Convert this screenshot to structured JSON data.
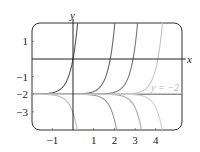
{
  "chart_data": {
    "type": "line",
    "title": "",
    "xlabel": "x",
    "ylabel": "y",
    "xlim": [
      -1.9,
      5.3
    ],
    "ylim": [
      -4.0,
      2.0
    ],
    "grid": false,
    "x_ticks": [
      -1,
      1,
      2,
      3,
      4
    ],
    "y_ticks": [
      1,
      -1,
      -2,
      -3
    ],
    "x_tick_labels": [
      "−1",
      "1",
      "2",
      "3",
      "4"
    ],
    "y_tick_labels": [
      "1",
      "−1",
      "−2",
      "−3"
    ],
    "asymptote": {
      "y": -2,
      "label": "y = −2",
      "style": "dashed",
      "color": "#c8c8c8"
    },
    "series": [
      {
        "name": "upper-solution-1",
        "branch": "upper",
        "zero_crossing_x": 0.0,
        "color": "#555555"
      },
      {
        "name": "upper-solution-2",
        "branch": "upper",
        "zero_crossing_x": 1.8,
        "color": "#666666"
      },
      {
        "name": "upper-solution-3",
        "branch": "upper",
        "zero_crossing_x": 2.9,
        "color": "#777777"
      },
      {
        "name": "upper-solution-4",
        "branch": "upper",
        "zero_crossing_x": 4.1,
        "color": "#c4c4c4"
      },
      {
        "name": "lower-solution-1",
        "branch": "lower",
        "bottom_crossing_x": 0.2,
        "color": "#bbbbbb"
      },
      {
        "name": "lower-solution-2",
        "branch": "lower",
        "bottom_crossing_x": 2.1,
        "color": "#999999"
      },
      {
        "name": "lower-solution-3",
        "branch": "lower",
        "bottom_crossing_x": 3.3,
        "color": "#aaaaaa"
      },
      {
        "name": "lower-solution-4",
        "branch": "lower",
        "bottom_crossing_x": 4.3,
        "color": "#d0d0d0"
      }
    ],
    "equilibrium_line": {
      "y": -2,
      "color": "#444444"
    }
  }
}
